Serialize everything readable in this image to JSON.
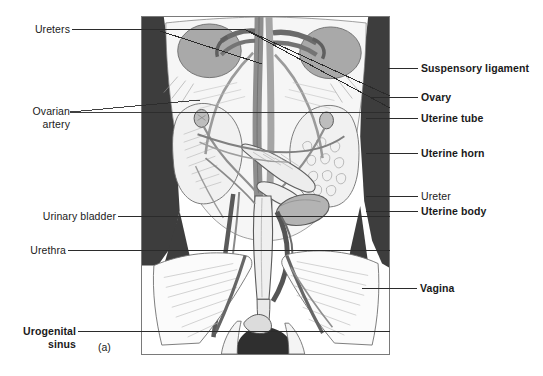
{
  "figure": {
    "panel_letter": "(a)",
    "caption_present": false
  },
  "labels_left": [
    {
      "id": "ureters",
      "text": "Ureters",
      "bold": false,
      "lines": [
        "Ureters"
      ]
    },
    {
      "id": "ovarian-artery",
      "text": "Ovarian artery",
      "bold": false,
      "lines": [
        "Ovarian",
        "artery"
      ]
    },
    {
      "id": "urinary-bladder",
      "text": "Urinary bladder",
      "bold": false,
      "lines": [
        "Urinary bladder"
      ]
    },
    {
      "id": "urethra",
      "text": "Urethra",
      "bold": false,
      "lines": [
        "Urethra"
      ]
    },
    {
      "id": "urogenital-sinus",
      "text": "Urogenital sinus",
      "bold": true,
      "lines": [
        "Urogenital",
        "sinus"
      ]
    }
  ],
  "labels_right": [
    {
      "id": "suspensory-ligament",
      "text": "Suspensory ligament",
      "bold": true
    },
    {
      "id": "ovary",
      "text": "Ovary",
      "bold": true
    },
    {
      "id": "uterine-tube",
      "text": "Uterine tube",
      "bold": true
    },
    {
      "id": "uterine-horn",
      "text": "Uterine horn",
      "bold": true
    },
    {
      "id": "ureter",
      "text": "Ureter",
      "bold": false
    },
    {
      "id": "uterine-body",
      "text": "Uterine body",
      "bold": true
    },
    {
      "id": "vagina",
      "text": "Vagina",
      "bold": true
    }
  ],
  "colors": {
    "text": "#1a1a1a",
    "leader_line": "#2b2b2b",
    "frame_border": "#7a7a7a",
    "background": "#ffffff",
    "dark_mass": "#3d3d3d",
    "vessel_dark": "#6f6f6f",
    "vessel_mid": "#9a9a9a",
    "organ_fill": "#f2f2f2",
    "organ_shade": "#c8c8c8",
    "kidney": "#a9a9a9",
    "outline": "#4a4a4a"
  }
}
